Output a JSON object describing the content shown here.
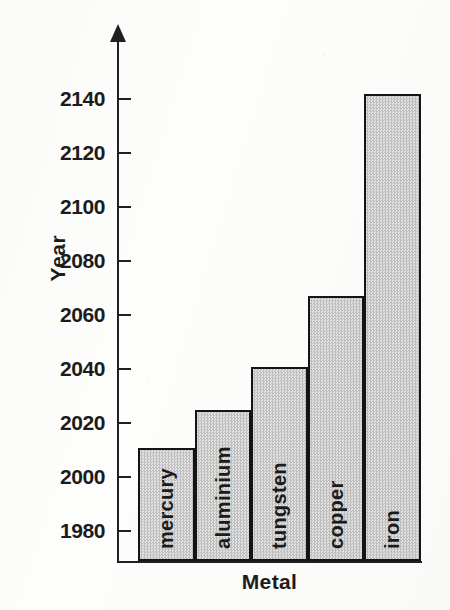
{
  "chart_data": {
    "type": "bar",
    "title": "",
    "xlabel": "Metal",
    "ylabel": "Year",
    "categories": [
      "mercury",
      "aluminium",
      "tungsten",
      "copper",
      "iron"
    ],
    "values": [
      2011,
      2025,
      2041,
      2067,
      2142
    ],
    "ytick_labels": [
      "2140",
      "2120",
      "2100",
      "2080",
      "2060",
      "2040",
      "2020",
      "2000",
      "1980"
    ],
    "yticks": [
      2140,
      2120,
      2100,
      2080,
      2060,
      2040,
      2020,
      2000,
      1980
    ],
    "ylim": [
      1971,
      2150
    ],
    "grid": false,
    "legend": null,
    "bar_fill_color": "#d2d2d2",
    "bar_border_color": "#141414",
    "axis_color": "#202020"
  },
  "axes": {
    "y_title": "Year",
    "x_title": "Metal"
  },
  "ticks": [
    {
      "label": "2140"
    },
    {
      "label": "2120"
    },
    {
      "label": "2100"
    },
    {
      "label": "2080"
    },
    {
      "label": "2060"
    },
    {
      "label": "2040"
    },
    {
      "label": "2020"
    },
    {
      "label": "2000"
    },
    {
      "label": "1980"
    }
  ],
  "bars": [
    {
      "label": "mercury",
      "value": 2011
    },
    {
      "label": "aluminium",
      "value": 2025
    },
    {
      "label": "tungsten",
      "value": 2041
    },
    {
      "label": "copper",
      "value": 2067
    },
    {
      "label": "iron",
      "value": 2142
    }
  ]
}
